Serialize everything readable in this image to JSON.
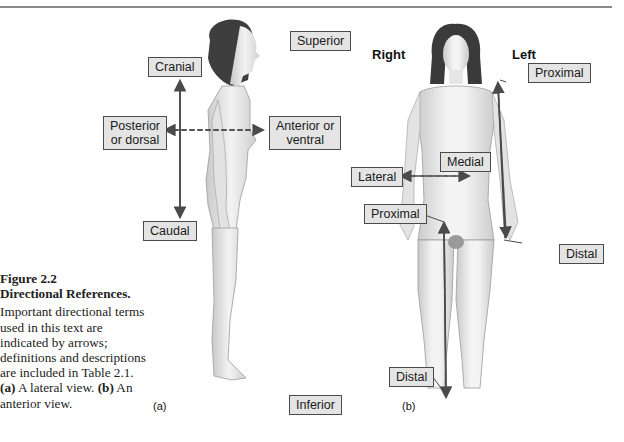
{
  "caption": {
    "figure_number": "Figure 2.2",
    "title": "Directional References.",
    "body_1": "Important directional terms used in this text are indicated by arrows; definitions and descriptions are included in Table 2.1. ",
    "part_a_tag": "(a)",
    "part_a_text": " A lateral view. ",
    "part_b_tag": "(b)",
    "part_b_text": " An anterior view."
  },
  "lateral_view": {
    "tag": "(a)",
    "labels": {
      "superior": "Superior",
      "inferior": "Inferior",
      "cranial": "Cranial",
      "caudal": "Caudal",
      "posterior": [
        "Posterior",
        "or dorsal"
      ],
      "anterior": [
        "Anterior or",
        "ventral"
      ]
    }
  },
  "anterior_view": {
    "tag": "(b)",
    "side_right": "Right",
    "side_left": "Left",
    "labels": {
      "proximal_arm": "Proximal",
      "distal_arm": "Distal",
      "medial": "Medial",
      "lateral": "Lateral",
      "proximal_leg": "Proximal",
      "distal_leg": "Distal"
    }
  },
  "colors": {
    "label_fill": "#e4e4e4",
    "label_border": "#4a4a4a",
    "arrow": "#4a4a4a",
    "skin_light": "#f2f2f2",
    "skin_shadow": "#bdbdbd",
    "hair": "#3a3a3a"
  }
}
